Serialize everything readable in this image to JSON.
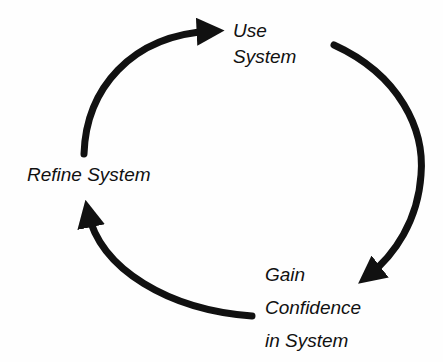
{
  "diagram": {
    "type": "cycle",
    "stroke_color": "#111111",
    "background": "#fefefe",
    "nodes": [
      {
        "id": "use",
        "lines": [
          "Use",
          "System"
        ]
      },
      {
        "id": "gain",
        "lines": [
          "Gain",
          "Confidence",
          "in System"
        ]
      },
      {
        "id": "refine",
        "lines": [
          "Refine System"
        ]
      }
    ],
    "edges": [
      {
        "from": "refine",
        "to": "use"
      },
      {
        "from": "use",
        "to": "gain"
      },
      {
        "from": "gain",
        "to": "refine"
      }
    ]
  }
}
